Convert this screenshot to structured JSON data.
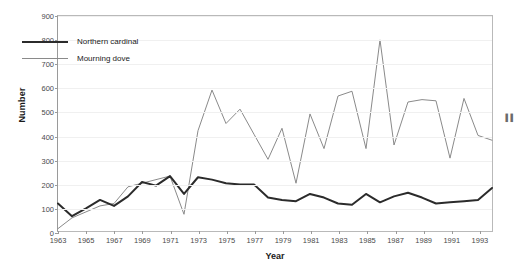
{
  "chart_data": {
    "type": "line",
    "title": "",
    "xlabel": "Year",
    "ylabel": "Number",
    "xlim": [
      1963,
      1994
    ],
    "ylim": [
      0,
      900
    ],
    "yticks": [
      0,
      100,
      200,
      300,
      400,
      500,
      600,
      700,
      800,
      900
    ],
    "xticks": [
      1963,
      1965,
      1967,
      1969,
      1971,
      1973,
      1975,
      1977,
      1979,
      1981,
      1983,
      1985,
      1987,
      1989,
      1991,
      1993
    ],
    "grid": "horizontal",
    "legend_position": "upper-left-inside",
    "x": [
      1963,
      1964,
      1965,
      1966,
      1967,
      1968,
      1969,
      1970,
      1971,
      1972,
      1973,
      1974,
      1975,
      1976,
      1977,
      1978,
      1979,
      1980,
      1981,
      1982,
      1983,
      1984,
      1985,
      1986,
      1987,
      1988,
      1989,
      1990,
      1991,
      1992,
      1993,
      1994
    ],
    "series": [
      {
        "name": "Northern cardinal",
        "color": "#2b2b2b",
        "width": 2,
        "values": [
          115,
          62,
          95,
          130,
          105,
          145,
          205,
          190,
          230,
          155,
          225,
          215,
          200,
          195,
          195,
          140,
          130,
          125,
          155,
          140,
          115,
          110,
          155,
          120,
          145,
          160,
          140,
          115,
          120,
          125,
          130,
          180
        ]
      },
      {
        "name": "Mourning dove",
        "color": "#8a8a8a",
        "width": 1,
        "values": [
          10,
          55,
          80,
          105,
          115,
          185,
          200,
          215,
          230,
          70,
          420,
          590,
          450,
          510,
          405,
          300,
          430,
          200,
          490,
          345,
          565,
          585,
          345,
          800,
          360,
          540,
          550,
          545,
          305,
          555,
          400,
          380
        ]
      }
    ]
  },
  "legend": {
    "items": [
      {
        "label": "Northern cardinal"
      },
      {
        "label": "Mourning dove"
      }
    ]
  },
  "edge": {
    "clipped_text": "▐▐▐▐▐▐▐▐"
  }
}
